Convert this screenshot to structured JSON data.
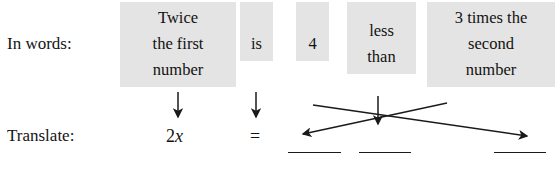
{
  "figure": {
    "type": "translate-words-to-algebra-diagram",
    "rows": {
      "words_label": "In words:",
      "translate_label": "Translate:"
    },
    "phrases": [
      {
        "id": "twice-first-number",
        "lines": [
          "Twice",
          "the first",
          "number"
        ]
      },
      {
        "id": "is",
        "lines": [
          "is"
        ]
      },
      {
        "id": "four",
        "lines": [
          "4"
        ]
      },
      {
        "id": "less-than",
        "lines": [
          "less",
          "than"
        ]
      },
      {
        "id": "three-times-second-number",
        "lines": [
          "3 times the",
          "second",
          "number"
        ]
      }
    ],
    "translation": {
      "expression_coefficient": "2",
      "expression_variable": "x",
      "equals_sign": "=",
      "blanks": [
        "",
        "",
        ""
      ]
    },
    "arrows": [
      {
        "id": "arrow-twice-down",
        "kind": "down",
        "from_phrase": "twice-first-number",
        "to": "2x"
      },
      {
        "id": "arrow-is-down",
        "kind": "down",
        "from_phrase": "is",
        "to": "="
      },
      {
        "id": "arrow-less-than-down",
        "kind": "down",
        "from_phrase": "less-than",
        "to": "blank-2"
      },
      {
        "id": "arrow-four-crossing",
        "kind": "diagonal-right",
        "from_phrase": "four",
        "to": "blank-3"
      },
      {
        "id": "arrow-second-number-crossing",
        "kind": "diagonal-left",
        "from_phrase": "three-times-second-number",
        "to": "blank-1"
      }
    ],
    "colors": {
      "chip_background": "#e4e4e4",
      "text": "#141414",
      "rule": "#1a1a1a",
      "page_background": "#ffffff"
    }
  }
}
